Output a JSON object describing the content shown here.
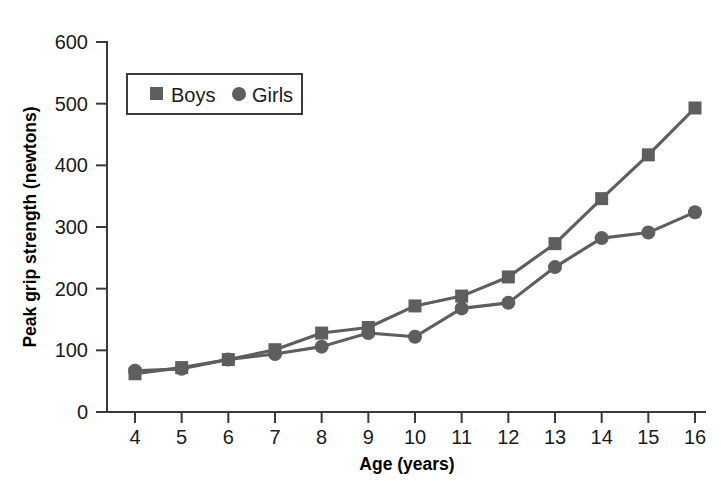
{
  "chart_data": {
    "type": "line",
    "title": "",
    "xlabel": "Age (years)",
    "ylabel": "Peak grip strength (newtons)",
    "x": [
      4,
      5,
      6,
      7,
      8,
      9,
      10,
      11,
      12,
      13,
      14,
      15,
      16
    ],
    "xtick_labels": [
      "4",
      "5",
      "6",
      "7",
      "8",
      "9",
      "10",
      "11",
      "12",
      "13",
      "14",
      "15",
      "16"
    ],
    "ytick_labels": [
      "0",
      "100",
      "200",
      "300",
      "400",
      "500",
      "600"
    ],
    "yticks": [
      0,
      100,
      200,
      300,
      400,
      500,
      600
    ],
    "xlim": [
      4,
      16
    ],
    "ylim": [
      0,
      600
    ],
    "grid": false,
    "legend_position": "upper-left-inside",
    "series": [
      {
        "name": "Boys",
        "marker": "square",
        "color": "#5e5e5e",
        "values": [
          62,
          72,
          85,
          101,
          128,
          137,
          172,
          188,
          219,
          273,
          346,
          417,
          493
        ]
      },
      {
        "name": "Girls",
        "marker": "circle",
        "color": "#5e5e5e",
        "values": [
          67,
          70,
          85,
          94,
          106,
          128,
          122,
          168,
          177,
          235,
          282,
          291,
          324
        ]
      }
    ]
  },
  "legend": {
    "items": [
      {
        "label": "Boys",
        "marker": "square"
      },
      {
        "label": "Girls",
        "marker": "circle"
      }
    ]
  },
  "colors": {
    "series": "#5e5e5e",
    "axis": "#3a3a3a",
    "text": "#1a1a1a",
    "background": "#ffffff"
  }
}
